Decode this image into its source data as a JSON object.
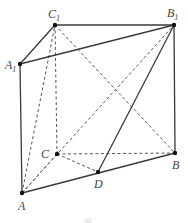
{
  "figure": {
    "caption": "图",
    "colors": {
      "line": "#3a3a3a",
      "dashed": "#555555",
      "point": "#111111",
      "label": "#444444"
    }
  },
  "points": {
    "A": {
      "label": "A",
      "sub": "",
      "x": 22,
      "y": 193
    },
    "B": {
      "label": "B",
      "sub": "",
      "x": 175,
      "y": 153
    },
    "C": {
      "label": "C",
      "sub": "",
      "x": 57,
      "y": 154
    },
    "D": {
      "label": "D",
      "sub": "",
      "x": 98,
      "y": 172
    },
    "A1": {
      "label": "A",
      "sub": "1",
      "x": 20,
      "y": 64
    },
    "B1": {
      "label": "B",
      "sub": "1",
      "x": 174,
      "y": 25
    },
    "C1": {
      "label": "C",
      "sub": "1",
      "x": 55,
      "y": 25
    }
  },
  "edges": {
    "solid": [
      "A1-C1",
      "C1-B1",
      "A1-B1",
      "A1-A",
      "B1-B",
      "A-D",
      "D-B",
      "D-B1"
    ],
    "dashed": [
      "C1-C",
      "A-C",
      "C-B",
      "C-D",
      "A-C1",
      "C1-B",
      "A-B1"
    ]
  }
}
